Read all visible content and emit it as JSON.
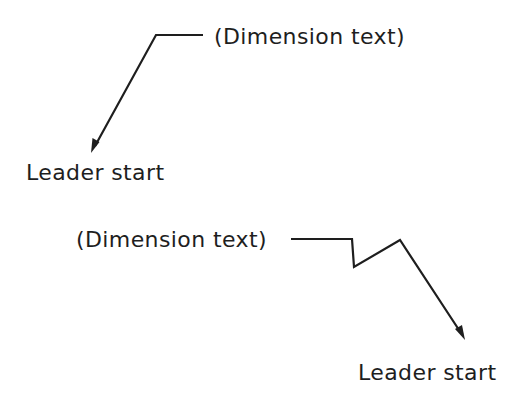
{
  "diagram": {
    "type": "leader-annotation-examples",
    "colors": {
      "line": "#1e1e1e",
      "text": "#1e1e1e",
      "background": "#ffffff"
    },
    "examples": [
      {
        "dimension_text": "(Dimension text)",
        "leader_label": "Leader start",
        "leader_shape": "straight-with-landing",
        "points": [
          [
            203,
            35
          ],
          [
            156,
            35
          ],
          [
            91,
            153
          ]
        ]
      },
      {
        "dimension_text": "(Dimension text)",
        "leader_label": "Leader start",
        "leader_shape": "jogged-with-landing",
        "points": [
          [
            291,
            239
          ],
          [
            352,
            239
          ],
          [
            354,
            267
          ],
          [
            400,
            240
          ],
          [
            465,
            340
          ]
        ]
      }
    ]
  }
}
